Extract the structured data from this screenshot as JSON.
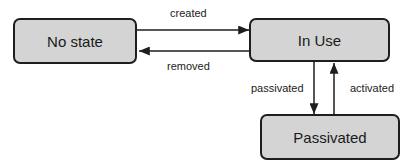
{
  "diagram": {
    "type": "state-diagram",
    "states": [
      {
        "id": "no_state",
        "label": "No state"
      },
      {
        "id": "in_use",
        "label": "In Use"
      },
      {
        "id": "passivated",
        "label": "Passivated"
      }
    ],
    "transitions": [
      {
        "from": "no_state",
        "to": "in_use",
        "label": "created"
      },
      {
        "from": "in_use",
        "to": "no_state",
        "label": "removed"
      },
      {
        "from": "in_use",
        "to": "passivated",
        "label": "passivated"
      },
      {
        "from": "passivated",
        "to": "in_use",
        "label": "activated"
      }
    ]
  },
  "colors": {
    "state_fill": "#d4d4d4",
    "stroke": "#1e1e1e",
    "background": "#ffffff"
  }
}
